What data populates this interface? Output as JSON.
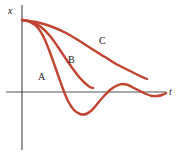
{
  "figure": {
    "title": "",
    "background_color": "#ffffff",
    "width": 178,
    "height": 156
  },
  "axes": {
    "x_axis_label": "t",
    "y_axis_label": "x",
    "axis_color": "#555555",
    "origin": {
      "x": 22,
      "y": 92
    },
    "x_axis_start": {
      "x": 6,
      "y": 92
    },
    "x_axis_end": {
      "x": 166,
      "y": 92
    },
    "y_axis_top": {
      "x": 22,
      "y": 5
    },
    "y_axis_bottom": {
      "x": 22,
      "y": 150
    }
  },
  "labels": {
    "a": "A",
    "b": "B",
    "c": "C",
    "a_pos": {
      "x": 38,
      "y": 80
    },
    "b_pos": {
      "x": 68,
      "y": 63
    },
    "c_pos": {
      "x": 99,
      "y": 44
    },
    "x_pos": {
      "x": 8,
      "y": 14
    },
    "t_pos": {
      "x": 169,
      "y": 95
    }
  },
  "chart_data": {
    "type": "line",
    "title": "",
    "xlabel": "t",
    "ylabel": "x",
    "grid": false,
    "legend": "inline-annotations",
    "axis_ranges": {
      "x": [
        0,
        1
      ],
      "y": [
        -0.45,
        1.0
      ]
    },
    "curve_color": "#C0442F",
    "curve_width": 2.4,
    "series": [
      {
        "name": "A",
        "description": "underdamped oscillation, decaying sinusoid crossing zero",
        "color": "#C0442F",
        "points": [
          [
            22,
            20
          ],
          [
            30,
            22
          ],
          [
            38,
            28
          ],
          [
            45,
            40
          ],
          [
            52,
            58
          ],
          [
            58,
            75
          ],
          [
            63,
            89
          ],
          [
            68,
            101
          ],
          [
            74,
            110
          ],
          [
            80,
            114
          ],
          [
            86,
            114
          ],
          [
            92,
            110
          ],
          [
            98,
            103
          ],
          [
            104,
            96
          ],
          [
            110,
            90
          ],
          [
            116,
            86
          ],
          [
            122,
            84
          ],
          [
            128,
            85
          ],
          [
            134,
            88
          ],
          [
            140,
            91
          ],
          [
            146,
            94
          ],
          [
            152,
            96
          ],
          [
            157,
            96
          ],
          [
            162,
            95
          ],
          [
            166,
            93
          ]
        ]
      },
      {
        "name": "B",
        "description": "critically damped, returns to zero without overshoot",
        "color": "#C0442F",
        "points": [
          [
            22,
            20
          ],
          [
            32,
            22
          ],
          [
            41,
            27
          ],
          [
            50,
            36
          ],
          [
            58,
            47
          ],
          [
            66,
            59
          ],
          [
            73,
            69
          ],
          [
            80,
            78
          ],
          [
            86,
            84
          ],
          [
            90,
            87
          ],
          [
            93,
            88
          ]
        ]
      },
      {
        "name": "C",
        "description": "overdamped, slow return toward zero",
        "color": "#C0442F",
        "points": [
          [
            22,
            20
          ],
          [
            36,
            22
          ],
          [
            50,
            26
          ],
          [
            64,
            32
          ],
          [
            78,
            40
          ],
          [
            92,
            49
          ],
          [
            105,
            57
          ],
          [
            118,
            65
          ],
          [
            130,
            71
          ],
          [
            140,
            76
          ],
          [
            147,
            79
          ]
        ]
      }
    ]
  }
}
